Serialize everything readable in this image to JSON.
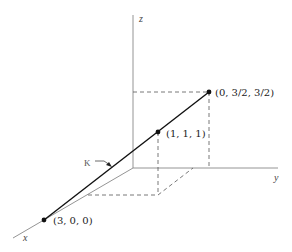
{
  "diagram": {
    "axes": {
      "x_label": "x",
      "y_label": "y",
      "z_label": "z"
    },
    "points": [
      {
        "label": "(0, 3/2, 3/2)",
        "coords": [
          0,
          1.5,
          1.5
        ]
      },
      {
        "label": "(1, 1, 1)",
        "coords": [
          1,
          1,
          1
        ]
      },
      {
        "label": "(3, 0, 0)",
        "coords": [
          3,
          0,
          0
        ]
      }
    ],
    "curve_label": "K",
    "colors": {
      "line": "#111111",
      "axis": "#777777",
      "dashed": "#555555"
    }
  }
}
